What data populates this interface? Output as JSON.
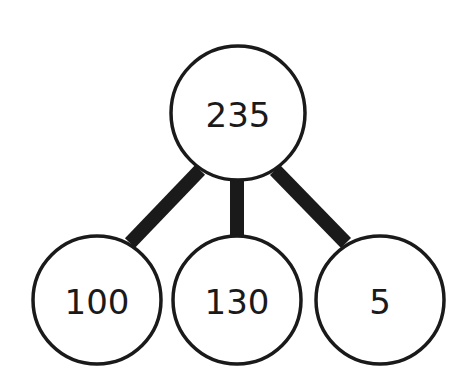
{
  "diagram": {
    "type": "number-bond",
    "root": {
      "label": "235",
      "cx": 238,
      "cy": 113,
      "r": 67
    },
    "children": [
      {
        "label": "100",
        "cx": 97,
        "cy": 300,
        "r": 64
      },
      {
        "label": "130",
        "cx": 237,
        "cy": 300,
        "r": 64
      },
      {
        "label": "5",
        "cx": 380,
        "cy": 300,
        "r": 64
      }
    ],
    "colors": {
      "stroke": "#1a1a1a",
      "fill": "#ffffff",
      "connector": "#1a1a1a"
    }
  }
}
